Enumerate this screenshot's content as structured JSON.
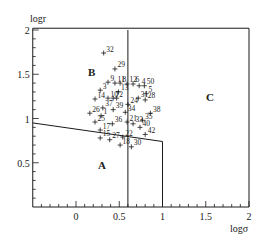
{
  "chart_data": {
    "type": "scatter",
    "title": "",
    "xlabel": "logσ",
    "ylabel": "logr",
    "xlim": [
      -0.5,
      2
    ],
    "ylim": [
      0,
      2
    ],
    "x_ticks": [
      {
        "value": 0,
        "label": "0"
      },
      {
        "value": 0.5,
        "label": "0.5"
      },
      {
        "value": 1,
        "label": "1"
      },
      {
        "value": 1.5,
        "label": "1.5"
      },
      {
        "value": 2,
        "label": "2"
      }
    ],
    "y_ticks": [
      {
        "value": 0.5,
        "label": "0.5"
      },
      {
        "value": 1,
        "label": "1"
      },
      {
        "value": 1.5,
        "label": "1.5"
      },
      {
        "value": 2,
        "label": "2"
      }
    ],
    "grid": false,
    "legend": null,
    "regions": [
      {
        "label": "A",
        "x": 0.3,
        "y": 0.43
      },
      {
        "label": "B",
        "x": 0.18,
        "y": 1.48
      },
      {
        "label": "C",
        "x": 1.55,
        "y": 1.2
      }
    ],
    "boundaries": [
      {
        "name": "A-upper",
        "points": [
          [
            -0.5,
            0.95
          ],
          [
            1.0,
            0.74
          ],
          [
            1.0,
            0
          ]
        ]
      },
      {
        "name": "B-C-divider",
        "points": [
          [
            0.6,
            2.0
          ],
          [
            0.6,
            0
          ]
        ]
      },
      {
        "name": "C-outer",
        "points": [
          [
            -0.5,
            2.02
          ],
          [
            2.0,
            2.02
          ],
          [
            2.0,
            0
          ]
        ]
      }
    ],
    "points": [
      {
        "label": "32",
        "x": 0.32,
        "y": 1.74
      },
      {
        "label": "29",
        "x": 0.45,
        "y": 1.56
      },
      {
        "label": "9",
        "x": 0.37,
        "y": 1.41
      },
      {
        "label": "11",
        "x": 0.45,
        "y": 1.4
      },
      {
        "label": "8",
        "x": 0.51,
        "y": 1.4
      },
      {
        "label": "12",
        "x": 0.59,
        "y": 1.39
      },
      {
        "label": "6",
        "x": 0.66,
        "y": 1.39
      },
      {
        "label": "4",
        "x": 0.73,
        "y": 1.37
      },
      {
        "label": "50",
        "x": 0.79,
        "y": 1.37
      },
      {
        "label": "3",
        "x": 0.28,
        "y": 1.32
      },
      {
        "label": "13",
        "x": 0.49,
        "y": 1.3
      },
      {
        "label": "5",
        "x": 0.81,
        "y": 1.28
      },
      {
        "label": "14",
        "x": 0.22,
        "y": 1.22
      },
      {
        "label": "10",
        "x": 0.37,
        "y": 1.23
      },
      {
        "label": "7",
        "x": 0.43,
        "y": 1.23
      },
      {
        "label": "2",
        "x": 0.47,
        "y": 1.23
      },
      {
        "label": "31",
        "x": 0.72,
        "y": 1.23
      },
      {
        "label": "28",
        "x": 0.8,
        "y": 1.21
      },
      {
        "label": "24",
        "x": 0.6,
        "y": 1.16
      },
      {
        "label": "37",
        "x": 0.31,
        "y": 1.12
      },
      {
        "label": "39",
        "x": 0.43,
        "y": 1.1
      },
      {
        "label": "34",
        "x": 0.57,
        "y": 1.07
      },
      {
        "label": "26",
        "x": 0.16,
        "y": 1.06
      },
      {
        "label": "1",
        "x": 0.29,
        "y": 1.03
      },
      {
        "label": "38",
        "x": 0.86,
        "y": 1.06
      },
      {
        "label": "35",
        "x": 0.77,
        "y": 0.98
      },
      {
        "label": "25",
        "x": 0.22,
        "y": 0.96
      },
      {
        "label": "36",
        "x": 0.42,
        "y": 0.94
      },
      {
        "label": "21",
        "x": 0.59,
        "y": 0.96
      },
      {
        "label": "33",
        "x": 0.66,
        "y": 0.94
      },
      {
        "label": "40",
        "x": 0.74,
        "y": 0.9
      },
      {
        "label": "17",
        "x": 0.28,
        "y": 0.87
      },
      {
        "label": "42",
        "x": 0.8,
        "y": 0.82
      },
      {
        "label": "15",
        "x": 0.28,
        "y": 0.78
      },
      {
        "label": "27",
        "x": 0.39,
        "y": 0.76
      },
      {
        "label": "22",
        "x": 0.54,
        "y": 0.79
      },
      {
        "label": "18",
        "x": 0.51,
        "y": 0.7
      },
      {
        "label": "30",
        "x": 0.64,
        "y": 0.68
      }
    ]
  },
  "axes": {
    "x_label": "logσ",
    "y_label": "logr"
  }
}
